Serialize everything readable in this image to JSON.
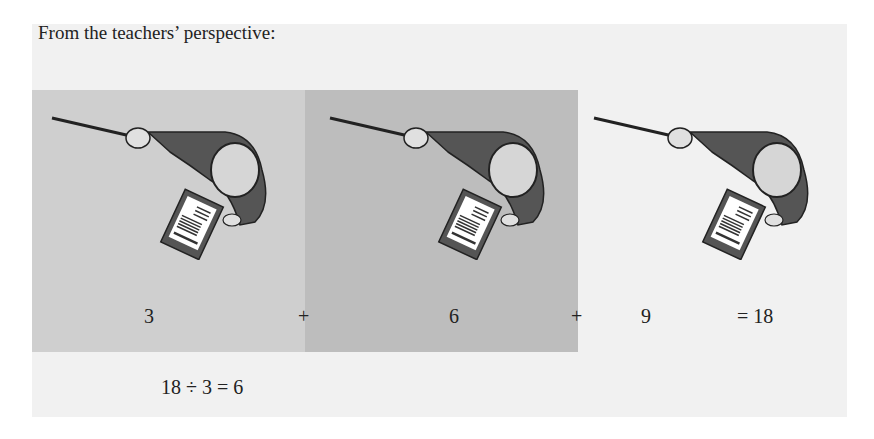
{
  "heading": "From the teachers’ perspective:",
  "panels": [
    {
      "value": "3",
      "shade": "#cfcfcf"
    },
    {
      "value": "6",
      "shade": "#bdbdbd"
    },
    {
      "value": "9",
      "shade": "#f1f1f1"
    }
  ],
  "operators": {
    "plus1": "+",
    "plus2": "+",
    "result": "= 18"
  },
  "division": "18 ÷ 3 = 6",
  "figure_icon": "teacher-with-pointer-and-clipboard-icon"
}
